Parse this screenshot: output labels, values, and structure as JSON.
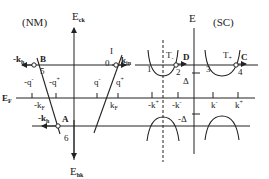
{
  "figure": {
    "nm_panel": {
      "title": "(NM)",
      "axis_up": {
        "main": "E",
        "sub": "ck"
      },
      "axis_down": {
        "main": "E",
        "sub": "hk"
      },
      "fermi_label": {
        "main": "E",
        "sub": "F"
      },
      "k_labels": {
        "minus_kF": "-k",
        "minus_kF_sub": "F",
        "kF": "k",
        "kF_sub": "F"
      },
      "q_labels": [
        "-q",
        "-q",
        "q",
        "q"
      ],
      "q_sup": [
        "-",
        "+",
        "-",
        "+"
      ],
      "points": {
        "B": "B",
        "A": "A",
        "I": "I",
        "O": "0",
        "n5": "5",
        "n6": "6"
      },
      "wave_labels": {
        "minus_kh_top": "-k",
        "minus_kh_top_sub": "h",
        "kin": "k",
        "kin_sub": "in",
        "minus_kh_bottom": "-k",
        "minus_kh_bottom_sub": "h"
      }
    },
    "sc_panel": {
      "title": "(SC)",
      "axis_up": "E",
      "gap_pos": "Δ",
      "gap_neg": "-Δ",
      "k_labels": [
        "-k",
        "-k",
        "k",
        "k"
      ],
      "k_sup": [
        "+",
        "-",
        "-",
        "+"
      ],
      "points": {
        "C": "C",
        "D": "D",
        "n1": "1",
        "n2": "2",
        "n3": "3",
        "n4": "4"
      },
      "transmission": {
        "T_minus": "T",
        "T_minus_sub": "-",
        "T_plus": "T",
        "T_plus_sub": "+"
      }
    }
  }
}
